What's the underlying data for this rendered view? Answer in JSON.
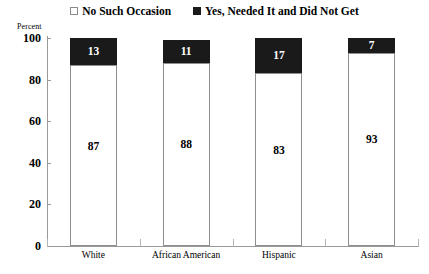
{
  "legend": {
    "items": [
      {
        "label": "No Such Occasion",
        "swatch": "open-square-icon",
        "color": "#ffffff"
      },
      {
        "label": "Yes, Needed It and Did Not Get",
        "swatch": "filled-square-icon",
        "color": "#1a1a1a"
      }
    ]
  },
  "axis": {
    "y_title": "Percent",
    "y_ticks": [
      "0",
      "20",
      "40",
      "60",
      "80",
      "100"
    ]
  },
  "chart_data": {
    "type": "bar",
    "title": "",
    "subtitle": "",
    "stacked": true,
    "stack_total": 100,
    "categories": [
      "White",
      "African American",
      "Hispanic",
      "Asian"
    ],
    "series": [
      {
        "name": "No Such Occasion",
        "color": "#ffffff",
        "values": [
          87,
          88,
          83,
          93
        ]
      },
      {
        "name": "Yes, Needed It and Did Not Get",
        "color": "#1a1a1a",
        "values": [
          13,
          11,
          17,
          7
        ]
      }
    ],
    "xlabel": "",
    "ylabel": "Percent",
    "ylim": [
      0,
      100
    ],
    "ytick_values": [
      0,
      20,
      40,
      60,
      80,
      100
    ],
    "grid": false,
    "legend_position": "top"
  }
}
